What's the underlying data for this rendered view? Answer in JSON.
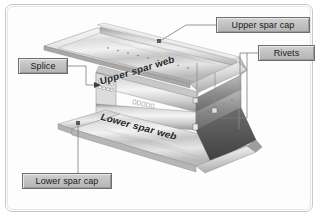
{
  "figure": {
    "frame_border_color": "#c9c9c9",
    "background_color": "#ffffff",
    "metal_light": "#f4f4f4",
    "metal_mid": "#bfbfbf",
    "metal_dark": "#7d7d7d",
    "metal_shadow": "#4f4f4f",
    "leader_color": "#7b7b7b",
    "label_fill": "#c4c4c4",
    "label_border": "#6e6e6e",
    "label_text_color": "#1a1a1a"
  },
  "callouts": [
    {
      "id": "upper-spar-cap",
      "label": "Upper spar cap",
      "x": 216,
      "y": 17,
      "w": 94,
      "h": 16
    },
    {
      "id": "rivets",
      "label": "Rivets",
      "x": 258,
      "y": 45,
      "w": 57,
      "h": 16
    },
    {
      "id": "splice",
      "label": "Splice",
      "x": 18,
      "y": 58,
      "w": 50,
      "h": 16
    },
    {
      "id": "lower-spar-cap",
      "label": "Lower spar cap",
      "x": 22,
      "y": 173,
      "w": 90,
      "h": 16
    }
  ],
  "inline_labels": [
    {
      "id": "upper-spar-web",
      "label": "Upper spar web"
    },
    {
      "id": "lower-spar-web",
      "label": "Lower spar web"
    }
  ]
}
